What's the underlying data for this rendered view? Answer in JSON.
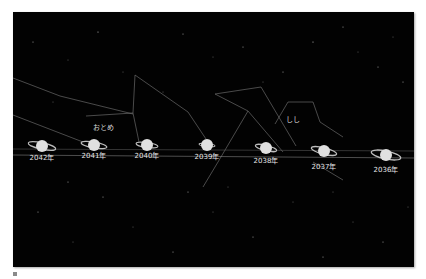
{
  "figure": {
    "background_color": "#020202",
    "constellations": [
      {
        "name": "おとめ",
        "label_pos": [
          80,
          112
        ]
      },
      {
        "name": "しし",
        "label_pos": [
          273,
          104
        ]
      }
    ],
    "saturn_positions": [
      {
        "year_label": "2042年",
        "x": 29,
        "y": 134
      },
      {
        "year_label": "2041年",
        "x": 81,
        "y": 133
      },
      {
        "year_label": "2040年",
        "x": 134,
        "y": 133
      },
      {
        "year_label": "2039年",
        "x": 194,
        "y": 133
      },
      {
        "year_label": "2038年",
        "x": 253,
        "y": 136
      },
      {
        "year_label": "2037年",
        "x": 311,
        "y": 139
      },
      {
        "year_label": "2036年",
        "x": 373,
        "y": 143
      }
    ]
  },
  "icons": {
    "saturn": "saturn-icon"
  }
}
